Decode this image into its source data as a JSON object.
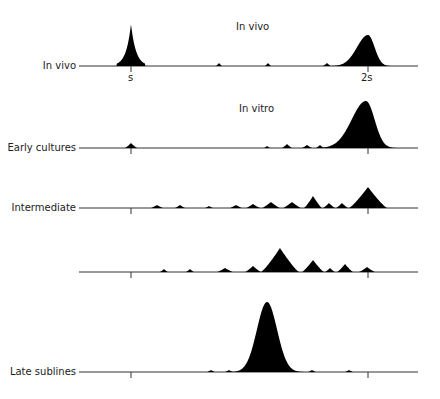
{
  "figure": {
    "titles": {
      "in_vivo": "In vivo",
      "in_vitro": "In vitro"
    },
    "tick_labels": {
      "s": "s",
      "two_s": "2s"
    },
    "rows": [
      {
        "label": "In vivo",
        "baseline_y": 66
      },
      {
        "label": "Early cultures",
        "baseline_y": 148
      },
      {
        "label": "Intermediate",
        "baseline_y": 208
      },
      {
        "label": "",
        "baseline_y": 272
      },
      {
        "label": "Late sublines",
        "baseline_y": 372
      }
    ],
    "colors": {
      "ink": "#000000",
      "line": "#333333",
      "background": "#ffffff"
    }
  },
  "chart_data": {
    "type": "area",
    "xlabel": "DNA content",
    "x_ticks": [
      {
        "label": "s",
        "x": 131
      },
      {
        "label": "2s",
        "x": 368
      }
    ],
    "axis_extent": [
      79,
      418
    ],
    "series": [
      {
        "name": "In vivo",
        "group": "In vivo",
        "baseline_y": 66,
        "peaks": [
          {
            "x": 131,
            "h": 42,
            "w": 12,
            "shape": "sharp"
          },
          {
            "x": 219,
            "h": 3,
            "w": 3
          },
          {
            "x": 268,
            "h": 3,
            "w": 3
          },
          {
            "x": 327,
            "h": 3,
            "w": 4
          },
          {
            "x": 368,
            "h": 31,
            "w": 20,
            "shape": "skew"
          }
        ]
      },
      {
        "name": "Early cultures",
        "group": "In vitro",
        "baseline_y": 148,
        "peaks": [
          {
            "x": 131,
            "h": 5,
            "w": 6
          },
          {
            "x": 267,
            "h": 2,
            "w": 3
          },
          {
            "x": 287,
            "h": 4,
            "w": 5
          },
          {
            "x": 307,
            "h": 3,
            "w": 5
          },
          {
            "x": 320,
            "h": 3,
            "w": 4
          },
          {
            "x": 366,
            "h": 47,
            "w": 26,
            "shape": "skew"
          }
        ]
      },
      {
        "name": "Intermediate",
        "group": "In vitro",
        "baseline_y": 208,
        "peaks": [
          {
            "x": 157,
            "h": 3,
            "w": 6
          },
          {
            "x": 180,
            "h": 3,
            "w": 5
          },
          {
            "x": 209,
            "h": 2,
            "w": 4
          },
          {
            "x": 236,
            "h": 3,
            "w": 6
          },
          {
            "x": 253,
            "h": 4,
            "w": 7
          },
          {
            "x": 271,
            "h": 6,
            "w": 9
          },
          {
            "x": 292,
            "h": 6,
            "w": 9
          },
          {
            "x": 313,
            "h": 12,
            "w": 9
          },
          {
            "x": 329,
            "h": 5,
            "w": 6
          },
          {
            "x": 342,
            "h": 5,
            "w": 6
          },
          {
            "x": 368,
            "h": 21,
            "w": 19
          }
        ]
      },
      {
        "name": "Unlabeled subline",
        "group": "In vitro",
        "baseline_y": 272,
        "peaks": [
          {
            "x": 164,
            "h": 3,
            "w": 4
          },
          {
            "x": 190,
            "h": 3,
            "w": 4
          },
          {
            "x": 225,
            "h": 4,
            "w": 8
          },
          {
            "x": 253,
            "h": 6,
            "w": 8
          },
          {
            "x": 280,
            "h": 24,
            "w": 19
          },
          {
            "x": 313,
            "h": 12,
            "w": 11
          },
          {
            "x": 330,
            "h": 4,
            "w": 5
          },
          {
            "x": 345,
            "h": 8,
            "w": 8
          },
          {
            "x": 367,
            "h": 5,
            "w": 8
          }
        ]
      },
      {
        "name": "Late sublines",
        "group": "In vitro",
        "baseline_y": 372,
        "peaks": [
          {
            "x": 211,
            "h": 2,
            "w": 4
          },
          {
            "x": 229,
            "h": 2,
            "w": 4
          },
          {
            "x": 267,
            "h": 70,
            "w": 24,
            "shape": "gauss"
          },
          {
            "x": 312,
            "h": 2,
            "w": 4
          },
          {
            "x": 349,
            "h": 2,
            "w": 4
          }
        ]
      }
    ]
  }
}
